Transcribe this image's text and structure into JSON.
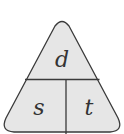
{
  "diagram": {
    "type": "formula-triangle",
    "top_label": "d",
    "bottom_left_label": "s",
    "bottom_right_label": "t",
    "colors": {
      "fill": "#e6e6e6",
      "stroke": "#3a3a3a",
      "text": "#333333"
    }
  }
}
